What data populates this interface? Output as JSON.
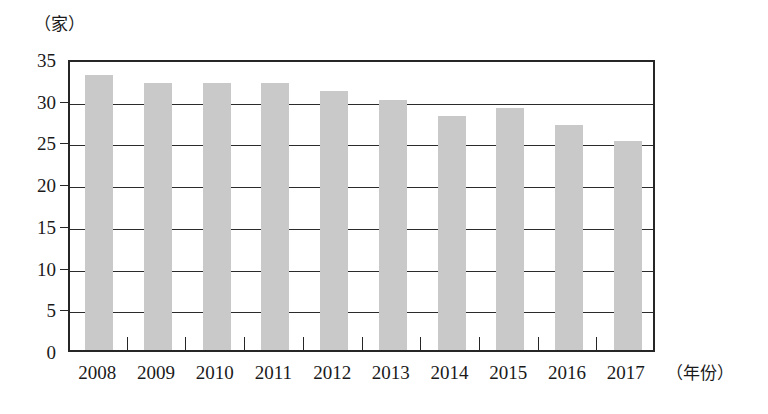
{
  "chart_data": {
    "type": "bar",
    "title": "",
    "subtitle": "",
    "xlabel": "（年份）",
    "ylabel": "（家）",
    "categories": [
      "2008",
      "2009",
      "2010",
      "2011",
      "2012",
      "2013",
      "2014",
      "2015",
      "2016",
      "2017"
    ],
    "values": [
      33,
      32,
      32,
      32,
      31,
      30,
      28,
      29,
      27,
      25
    ],
    "ylim": [
      0,
      35
    ],
    "yticks": [
      0,
      5,
      10,
      15,
      20,
      25,
      30,
      35
    ],
    "ytick_labels": [
      "0",
      "5",
      "10",
      "15",
      "20",
      "25",
      "30",
      "35"
    ],
    "grid": true,
    "grid_axis": "y",
    "legend": false,
    "legend_position": "none",
    "bar_color": "#c9c9c9",
    "axis_color": "#262626",
    "background_color": "#ffffff"
  },
  "axes": {
    "y_unit": "（家）",
    "x_unit": "（年份）"
  }
}
